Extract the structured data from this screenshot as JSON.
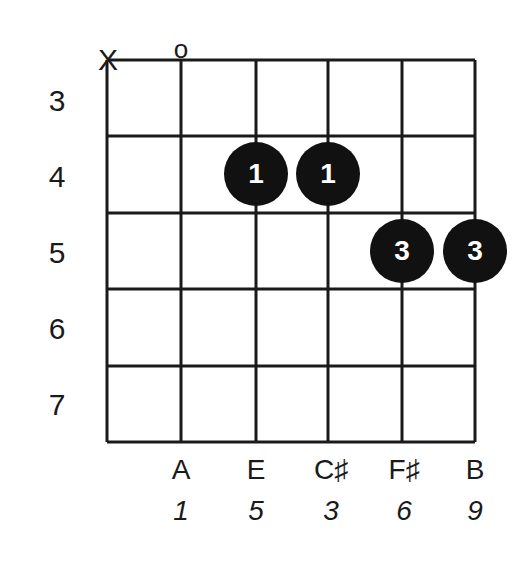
{
  "chord": {
    "string_markers": [
      {
        "string": 6,
        "symbol": "X",
        "meaning": "muted"
      },
      {
        "string": 5,
        "symbol": "o",
        "meaning": "open"
      }
    ],
    "fret_labels": [
      "3",
      "4",
      "5",
      "6",
      "7"
    ],
    "dots": [
      {
        "string": 4,
        "fret": "4",
        "finger": "1"
      },
      {
        "string": 3,
        "fret": "4",
        "finger": "1"
      },
      {
        "string": 2,
        "fret": "5",
        "finger": "3"
      },
      {
        "string": 1,
        "fret": "5",
        "finger": "3"
      }
    ],
    "notes": [
      "A",
      "E",
      "C♯",
      "F♯",
      "B"
    ],
    "intervals": [
      "1",
      "5",
      "3",
      "6",
      "9"
    ]
  },
  "colors": {
    "line": "#1a1a1a",
    "dot": "#111111",
    "dot_text": "#ffffff",
    "background": "#ffffff"
  }
}
